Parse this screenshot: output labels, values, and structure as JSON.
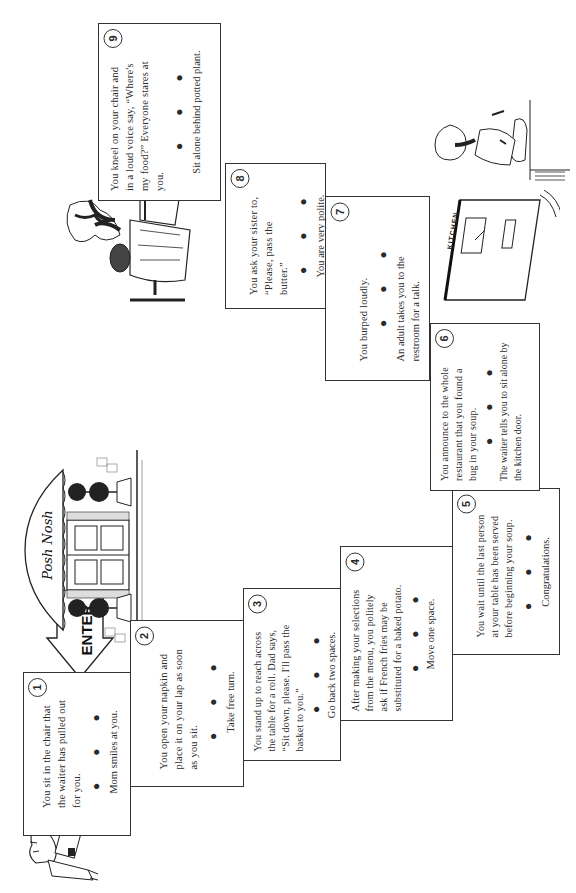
{
  "game": {
    "orientation": "rotated-90-ccw",
    "sign": {
      "restaurant_name": "Posh Nosh",
      "enter_label": "ENTER"
    },
    "kitchen_door_label": "KITCHEN",
    "dots": "● ● ●",
    "spaces": [
      {
        "number": "1",
        "text": "You sit in the chair that the waiter has pulled out for you.",
        "result": "Mom smiles at you."
      },
      {
        "number": "2",
        "text": "You open your napkin and place it on your lap as soon as you sit.",
        "result": "Take free turn."
      },
      {
        "number": "3",
        "text": "You stand up to reach across the table for a roll. Dad says, “Sit down, please. I'll pass the basket to you.”",
        "result": "Go back two spaces."
      },
      {
        "number": "4",
        "text": "After making your selections from the menu, you politely ask if French fries may be substituted for a baked potato.",
        "result": "Move one space."
      },
      {
        "number": "5",
        "text": "You wait until the last person at your table has been served before beginning your soup.",
        "result": "Congratulations."
      },
      {
        "number": "6",
        "text": "You announce to the whole restaurant that you found a bug in your soup.",
        "result": "The waiter tells you to sit alone by the kitchen door."
      },
      {
        "number": "7",
        "text": "You burped loudly.",
        "result": "An adult takes you to the restroom for a talk."
      },
      {
        "number": "8",
        "text": "You ask your sister to, “Please, pass the butter.”",
        "result": "You are very polite."
      },
      {
        "number": "9",
        "text": "You kneel on your chair and in a loud voice say, “Where's my food?” Everyone stares at you.",
        "result": "Sit alone behind potted plant."
      }
    ]
  }
}
